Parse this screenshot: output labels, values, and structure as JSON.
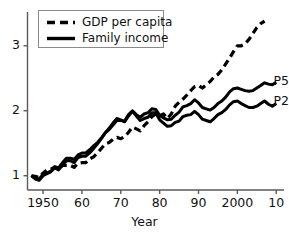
{
  "chart_data": {
    "type": "line",
    "title": "",
    "xlabel": "Year",
    "ylabel": "",
    "xlim": [
      1946,
      2012
    ],
    "ylim": [
      0.78,
      3.52
    ],
    "grid": false,
    "legend_position": "top-left",
    "x_ticks": [
      {
        "value": 1950,
        "label": "1950"
      },
      {
        "value": 1960,
        "label": "60"
      },
      {
        "value": 1970,
        "label": "70"
      },
      {
        "value": 1980,
        "label": "80"
      },
      {
        "value": 1990,
        "label": "90"
      },
      {
        "value": 2000,
        "label": "2000"
      },
      {
        "value": 2010,
        "label": "10"
      }
    ],
    "y_ticks": [
      {
        "value": 1,
        "label": "1"
      },
      {
        "value": 2,
        "label": "2"
      },
      {
        "value": 3,
        "label": "3"
      }
    ],
    "legend": [
      {
        "label": "GDP per capita",
        "style": "dashed"
      },
      {
        "label": "Family income",
        "style": "solid"
      }
    ],
    "annotations": [
      {
        "text": "P50",
        "x": 2008,
        "y": 2.45
      },
      {
        "text": "P20",
        "x": 2008,
        "y": 2.13
      }
    ],
    "series": [
      {
        "name": "GDP per capita",
        "style": "dashed",
        "x": [
          1947,
          1948,
          1949,
          1950,
          1951,
          1952,
          1953,
          1954,
          1955,
          1956,
          1957,
          1958,
          1959,
          1960,
          1961,
          1962,
          1963,
          1964,
          1965,
          1966,
          1967,
          1968,
          1969,
          1970,
          1971,
          1972,
          1973,
          1974,
          1975,
          1976,
          1977,
          1978,
          1979,
          1980,
          1981,
          1982,
          1983,
          1984,
          1985,
          1986,
          1987,
          1988,
          1989,
          1990,
          1991,
          1992,
          1993,
          1994,
          1995,
          1996,
          1997,
          1998,
          1999,
          2000,
          2001,
          2002,
          2003,
          2004,
          2005,
          2006,
          2007
        ],
        "values": [
          1.0,
          0.99,
          0.97,
          1.04,
          1.09,
          1.1,
          1.13,
          1.1,
          1.16,
          1.16,
          1.16,
          1.13,
          1.19,
          1.2,
          1.2,
          1.26,
          1.29,
          1.35,
          1.42,
          1.49,
          1.51,
          1.56,
          1.59,
          1.57,
          1.6,
          1.67,
          1.75,
          1.72,
          1.69,
          1.77,
          1.83,
          1.91,
          1.95,
          1.92,
          1.95,
          1.88,
          1.95,
          2.07,
          2.13,
          2.18,
          2.24,
          2.31,
          2.37,
          2.39,
          2.35,
          2.4,
          2.45,
          2.52,
          2.56,
          2.63,
          2.72,
          2.81,
          2.91,
          3.0,
          3.0,
          3.03,
          3.1,
          3.19,
          3.28,
          3.34,
          3.38
        ]
      },
      {
        "name": "Family income P50",
        "style": "solid",
        "x": [
          1947,
          1948,
          1949,
          1950,
          1951,
          1952,
          1953,
          1954,
          1955,
          1956,
          1957,
          1958,
          1959,
          1960,
          1961,
          1962,
          1963,
          1964,
          1965,
          1966,
          1967,
          1968,
          1969,
          1970,
          1971,
          1972,
          1973,
          1974,
          1975,
          1976,
          1977,
          1978,
          1979,
          1980,
          1981,
          1982,
          1983,
          1984,
          1985,
          1986,
          1987,
          1988,
          1989,
          1990,
          1991,
          1992,
          1993,
          1994,
          1995,
          1996,
          1997,
          1998,
          1999,
          2000,
          2001,
          2002,
          2003,
          2004,
          2005,
          2006,
          2007,
          2008,
          2009,
          2010
        ],
        "values": [
          1.0,
          0.96,
          0.95,
          1.02,
          1.04,
          1.07,
          1.14,
          1.12,
          1.2,
          1.27,
          1.27,
          1.25,
          1.32,
          1.35,
          1.35,
          1.4,
          1.46,
          1.51,
          1.58,
          1.66,
          1.71,
          1.78,
          1.85,
          1.85,
          1.84,
          1.94,
          2.0,
          1.94,
          1.9,
          1.95,
          1.97,
          2.03,
          2.02,
          1.93,
          1.89,
          1.86,
          1.87,
          1.93,
          1.98,
          2.06,
          2.08,
          2.11,
          2.17,
          2.12,
          2.05,
          2.03,
          2.01,
          2.05,
          2.11,
          2.15,
          2.21,
          2.29,
          2.34,
          2.35,
          2.33,
          2.31,
          2.3,
          2.31,
          2.35,
          2.39,
          2.43,
          2.41,
          2.4,
          2.44
        ]
      },
      {
        "name": "Family income P20",
        "style": "solid",
        "x": [
          1947,
          1948,
          1949,
          1950,
          1951,
          1952,
          1953,
          1954,
          1955,
          1956,
          1957,
          1958,
          1959,
          1960,
          1961,
          1962,
          1963,
          1964,
          1965,
          1966,
          1967,
          1968,
          1969,
          1970,
          1971,
          1972,
          1973,
          1974,
          1975,
          1976,
          1977,
          1978,
          1979,
          1980,
          1981,
          1982,
          1983,
          1984,
          1985,
          1986,
          1987,
          1988,
          1989,
          1990,
          1991,
          1992,
          1993,
          1994,
          1995,
          1996,
          1997,
          1998,
          1999,
          2000,
          2001,
          2002,
          2003,
          2004,
          2005,
          2006,
          2007,
          2008,
          2009,
          2010
        ],
        "values": [
          1.0,
          0.95,
          0.93,
          1.0,
          1.03,
          1.06,
          1.12,
          1.09,
          1.16,
          1.23,
          1.23,
          1.2,
          1.28,
          1.3,
          1.3,
          1.35,
          1.42,
          1.49,
          1.57,
          1.66,
          1.73,
          1.81,
          1.88,
          1.86,
          1.83,
          1.92,
          1.99,
          1.92,
          1.85,
          1.88,
          1.9,
          1.97,
          1.97,
          1.86,
          1.81,
          1.76,
          1.77,
          1.82,
          1.84,
          1.91,
          1.93,
          1.94,
          1.99,
          1.94,
          1.87,
          1.85,
          1.83,
          1.88,
          1.94,
          1.97,
          2.02,
          2.09,
          2.14,
          2.15,
          2.11,
          2.08,
          2.05,
          2.05,
          2.07,
          2.11,
          2.15,
          2.1,
          2.07,
          2.11
        ]
      }
    ]
  },
  "axis": {
    "x_title": "Year"
  },
  "legend": {
    "entries": [
      {
        "label": "GDP per capita"
      },
      {
        "label": "Family income"
      }
    ]
  },
  "labels": {
    "p50": "P50",
    "p20": "P20"
  },
  "colors": {
    "line": "#000000",
    "axis": "#5a5a5a",
    "legend_border": "#8a8a8a",
    "background": "#ffffff"
  }
}
